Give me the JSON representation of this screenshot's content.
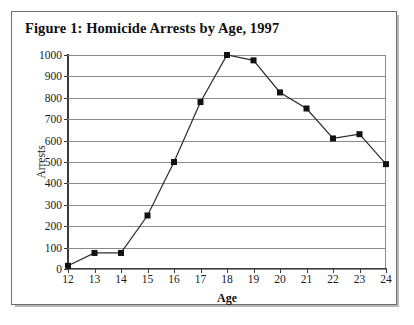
{
  "clipped_header_text": "",
  "figure": {
    "title": "Figure 1: Homicide Arrests by Age, 1997"
  },
  "chart_data": {
    "type": "line",
    "title": "Figure 1: Homicide Arrests by Age, 1997",
    "xlabel": "Age",
    "ylabel": "Arrests",
    "x": [
      12,
      13,
      14,
      15,
      16,
      17,
      18,
      19,
      20,
      21,
      22,
      23,
      24
    ],
    "categories": [
      "12",
      "13",
      "14",
      "15",
      "16",
      "17",
      "18",
      "19",
      "20",
      "21",
      "22",
      "23",
      "24"
    ],
    "values": [
      15,
      75,
      75,
      250,
      500,
      780,
      1000,
      975,
      825,
      750,
      610,
      630,
      490
    ],
    "series": [
      {
        "name": "Homicide arrests",
        "values": [
          15,
          75,
          75,
          250,
          500,
          780,
          1000,
          975,
          825,
          750,
          610,
          630,
          490
        ]
      }
    ],
    "xlim": [
      12,
      24
    ],
    "ylim": [
      0,
      1000
    ],
    "ytick_labels": [
      "0",
      "100",
      "200",
      "300",
      "400",
      "500",
      "600",
      "700",
      "800",
      "900",
      "1000"
    ],
    "yticks": [
      0,
      100,
      200,
      300,
      400,
      500,
      600,
      700,
      800,
      900,
      1000
    ],
    "grid": "horizontal",
    "legend": "none",
    "marker": "square",
    "line_color": "#2b2b2b",
    "marker_color": "#111111",
    "grid_color": "#8a8a8a"
  }
}
